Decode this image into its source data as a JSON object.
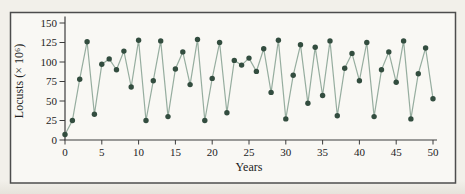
{
  "figure": {
    "page_background": "#f2f0ea",
    "inner_background": "#f9f8f4",
    "border_color": "#4d4d4d"
  },
  "chart_data": {
    "type": "line",
    "title": "",
    "xlabel": "Years",
    "ylabel": "Locusts (× 10⁶)",
    "xlim": [
      0,
      50
    ],
    "ylim": [
      0,
      150
    ],
    "x_ticks": [
      0,
      5,
      10,
      15,
      20,
      25,
      30,
      35,
      40,
      45,
      50
    ],
    "y_ticks": [
      0,
      25,
      50,
      75,
      100,
      125,
      150
    ],
    "grid": false,
    "legend": "none",
    "line_color": "#96ad9f",
    "marker_color": "#334d3f",
    "x": [
      0,
      1,
      2,
      3,
      4,
      5,
      6,
      7,
      8,
      9,
      10,
      11,
      12,
      13,
      14,
      15,
      16,
      17,
      18,
      19,
      20,
      21,
      22,
      23,
      24,
      25,
      26,
      27,
      28,
      29,
      30,
      31,
      32,
      33,
      34,
      35,
      36,
      37,
      38,
      39,
      40,
      41,
      42,
      43,
      44,
      45,
      46,
      47,
      48,
      49,
      50
    ],
    "values": [
      7,
      25,
      78,
      126,
      33,
      97,
      104,
      90,
      114,
      68,
      128,
      25,
      76,
      127,
      30,
      91,
      113,
      71,
      129,
      25,
      79,
      125,
      35,
      102,
      96,
      105,
      88,
      117,
      61,
      128,
      27,
      83,
      122,
      47,
      119,
      57,
      127,
      31,
      92,
      111,
      76,
      125,
      30,
      90,
      113,
      74,
      127,
      27,
      85,
      118,
      53
    ]
  }
}
